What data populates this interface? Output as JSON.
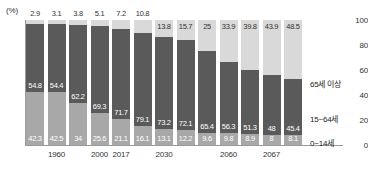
{
  "chart_data": {
    "type": "bar",
    "stacked": true,
    "title": "",
    "xlabel": "",
    "ylabel": "",
    "unit_label": "(%)",
    "ylim": [
      0,
      100
    ],
    "yticks": [
      "0",
      "20",
      "40",
      "60",
      "80",
      "100"
    ],
    "grid": false,
    "legend_position": "right",
    "categories": [
      "",
      "1960",
      "",
      "2000",
      "2017",
      "",
      "2030",
      "",
      "",
      "2060",
      "",
      "2067",
      ""
    ],
    "x_tick_labels": [
      "1960",
      "2000",
      "2017",
      "2030",
      "2060",
      "2067"
    ],
    "x_tick_bar_index": [
      1,
      3,
      4,
      6,
      9,
      11
    ],
    "series": [
      {
        "name": "65세 이상",
        "color": "#d9d9d9",
        "values": [
          2.9,
          3.1,
          3.8,
          5.1,
          7.2,
          10.8,
          13.8,
          15.7,
          25,
          33.9,
          39.8,
          43.9,
          48.5
        ]
      },
      {
        "name": "15~64세",
        "color": "#5a5a5a",
        "values": [
          54.8,
          54.4,
          62.2,
          69.3,
          71.7,
          79.1,
          73.2,
          72.1,
          65.4,
          56.3,
          51.3,
          48,
          45.4
        ]
      },
      {
        "name": "0~14세",
        "color": "#a8a8a8",
        "values": [
          42.3,
          42.5,
          34,
          25.6,
          21.1,
          16.1,
          13.1,
          12.2,
          9.6,
          9.8,
          8.9,
          8,
          8.1
        ]
      }
    ]
  },
  "legend": {
    "items": [
      {
        "label": "65세 이상",
        "color": "#d9d9d9"
      },
      {
        "label": "15~64세",
        "color": "#5a5a5a"
      },
      {
        "label": "0~14세",
        "color": "#a8a8a8"
      }
    ]
  }
}
